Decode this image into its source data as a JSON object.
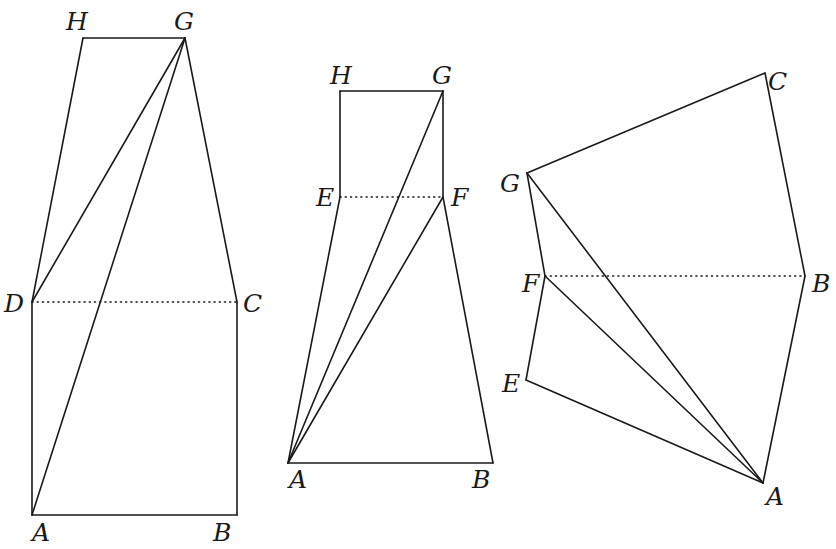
{
  "figures": [
    {
      "id": "fig1",
      "points": {
        "H": {
          "x": 83,
          "y": 38,
          "lx": 66,
          "ly": 30
        },
        "G": {
          "x": 185,
          "y": 38,
          "lx": 174,
          "ly": 30
        },
        "D": {
          "x": 32,
          "y": 302,
          "lx": 4,
          "ly": 312
        },
        "C": {
          "x": 237,
          "y": 302,
          "lx": 243,
          "ly": 312
        },
        "A": {
          "x": 32,
          "y": 515,
          "lx": 32,
          "ly": 541
        },
        "B": {
          "x": 237,
          "y": 515,
          "lx": 213,
          "ly": 541
        }
      },
      "edges": [
        [
          "H",
          "G"
        ],
        [
          "H",
          "D"
        ],
        [
          "G",
          "D"
        ],
        [
          "G",
          "A"
        ],
        [
          "G",
          "C"
        ],
        [
          "D",
          "A"
        ],
        [
          "C",
          "B"
        ],
        [
          "A",
          "B"
        ]
      ],
      "dotted": [
        [
          "D",
          "C"
        ]
      ]
    },
    {
      "id": "fig2",
      "points": {
        "H": {
          "x": 340,
          "y": 91,
          "lx": 330,
          "ly": 84
        },
        "G": {
          "x": 443,
          "y": 91,
          "lx": 432,
          "ly": 84
        },
        "E": {
          "x": 340,
          "y": 197,
          "lx": 316,
          "ly": 206
        },
        "F": {
          "x": 443,
          "y": 197,
          "lx": 451,
          "ly": 206
        },
        "A": {
          "x": 288,
          "y": 463,
          "lx": 289,
          "ly": 488
        },
        "B": {
          "x": 493,
          "y": 463,
          "lx": 472,
          "ly": 488
        }
      },
      "edges": [
        [
          "H",
          "G"
        ],
        [
          "H",
          "E"
        ],
        [
          "G",
          "F"
        ],
        [
          "G",
          "A"
        ],
        [
          "F",
          "A"
        ],
        [
          "E",
          "A"
        ],
        [
          "F",
          "B"
        ],
        [
          "A",
          "B"
        ]
      ],
      "dotted": [
        [
          "E",
          "F"
        ]
      ]
    },
    {
      "id": "fig3",
      "points": {
        "C": {
          "x": 765,
          "y": 73,
          "lx": 768,
          "ly": 90
        },
        "G": {
          "x": 527,
          "y": 173,
          "lx": 500,
          "ly": 192
        },
        "F": {
          "x": 545,
          "y": 276,
          "lx": 522,
          "ly": 292
        },
        "B": {
          "x": 805,
          "y": 276,
          "lx": 812,
          "ly": 292
        },
        "E": {
          "x": 526,
          "y": 380,
          "lx": 502,
          "ly": 392
        },
        "A": {
          "x": 763,
          "y": 483,
          "lx": 766,
          "ly": 505
        }
      },
      "edges": [
        [
          "G",
          "C"
        ],
        [
          "C",
          "B"
        ],
        [
          "G",
          "F"
        ],
        [
          "G",
          "A"
        ],
        [
          "F",
          "A"
        ],
        [
          "F",
          "E"
        ],
        [
          "E",
          "A"
        ],
        [
          "B",
          "A"
        ]
      ],
      "dotted": [
        [
          "F",
          "B"
        ]
      ]
    }
  ]
}
